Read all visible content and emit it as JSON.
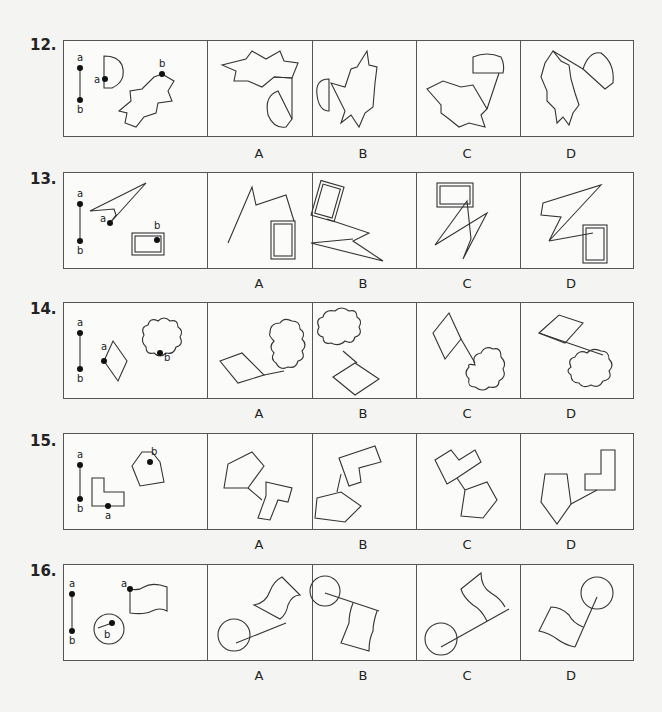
{
  "questions": [
    {
      "number": "12.",
      "options": [
        "A",
        "B",
        "C",
        "D"
      ],
      "stem_shapes": [
        "semicircle",
        "star-polygon"
      ]
    },
    {
      "number": "13.",
      "options": [
        "A",
        "B",
        "C",
        "D"
      ],
      "stem_shapes": [
        "lightning-bolt",
        "double-rectangle"
      ]
    },
    {
      "number": "14.",
      "options": [
        "A",
        "B",
        "C",
        "D"
      ],
      "stem_shapes": [
        "rhombus",
        "cloud"
      ]
    },
    {
      "number": "15.",
      "options": [
        "A",
        "B",
        "C",
        "D"
      ],
      "stem_shapes": [
        "L-shape",
        "pentagon"
      ]
    },
    {
      "number": "16.",
      "options": [
        "A",
        "B",
        "C",
        "D"
      ],
      "stem_shapes": [
        "circle-with-radius",
        "wavy-flag"
      ]
    }
  ],
  "point_labels": {
    "a": "a",
    "b": "b"
  }
}
